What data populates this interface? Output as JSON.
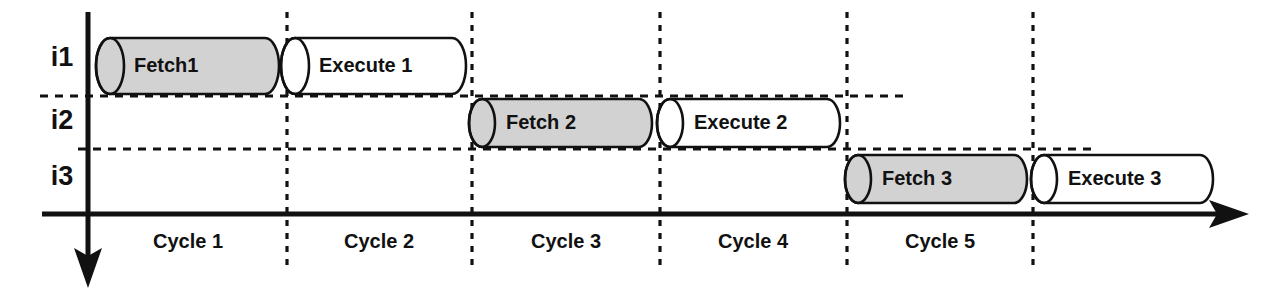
{
  "diagram": {
    "colors": {
      "fetch_fill": "#d2d2d2",
      "execute_fill": "#ffffff",
      "stroke": "#111111",
      "background": "#ffffff"
    },
    "rows": [
      {
        "id": "i1",
        "label": "i1"
      },
      {
        "id": "i2",
        "label": "i2"
      },
      {
        "id": "i3",
        "label": "i3"
      }
    ],
    "cycles": [
      {
        "id": "cycle-1",
        "label": "Cycle 1"
      },
      {
        "id": "cycle-2",
        "label": "Cycle 2"
      },
      {
        "id": "cycle-3",
        "label": "Cycle 3"
      },
      {
        "id": "cycle-4",
        "label": "Cycle 4"
      },
      {
        "id": "cycle-5",
        "label": "Cycle 5"
      }
    ],
    "stages": [
      {
        "id": "fetch-1",
        "label": "Fetch1",
        "row": "i1",
        "cycle": "Cycle 1",
        "kind": "fetch"
      },
      {
        "id": "execute-1",
        "label": "Execute 1",
        "row": "i1",
        "cycle": "Cycle 2",
        "kind": "execute"
      },
      {
        "id": "fetch-2",
        "label": "Fetch 2",
        "row": "i2",
        "cycle": "Cycle 3",
        "kind": "fetch"
      },
      {
        "id": "execute-2",
        "label": "Execute 2",
        "row": "i2",
        "cycle": "Cycle 4",
        "kind": "execute"
      },
      {
        "id": "fetch-3",
        "label": "Fetch 3",
        "row": "i3",
        "cycle": "Cycle 5",
        "kind": "fetch"
      },
      {
        "id": "execute-3",
        "label": "Execute 3",
        "row": "i3",
        "cycle": "Cycle 6",
        "kind": "execute"
      }
    ],
    "axes": {
      "horizontal_label": "",
      "vertical_label": ""
    }
  }
}
